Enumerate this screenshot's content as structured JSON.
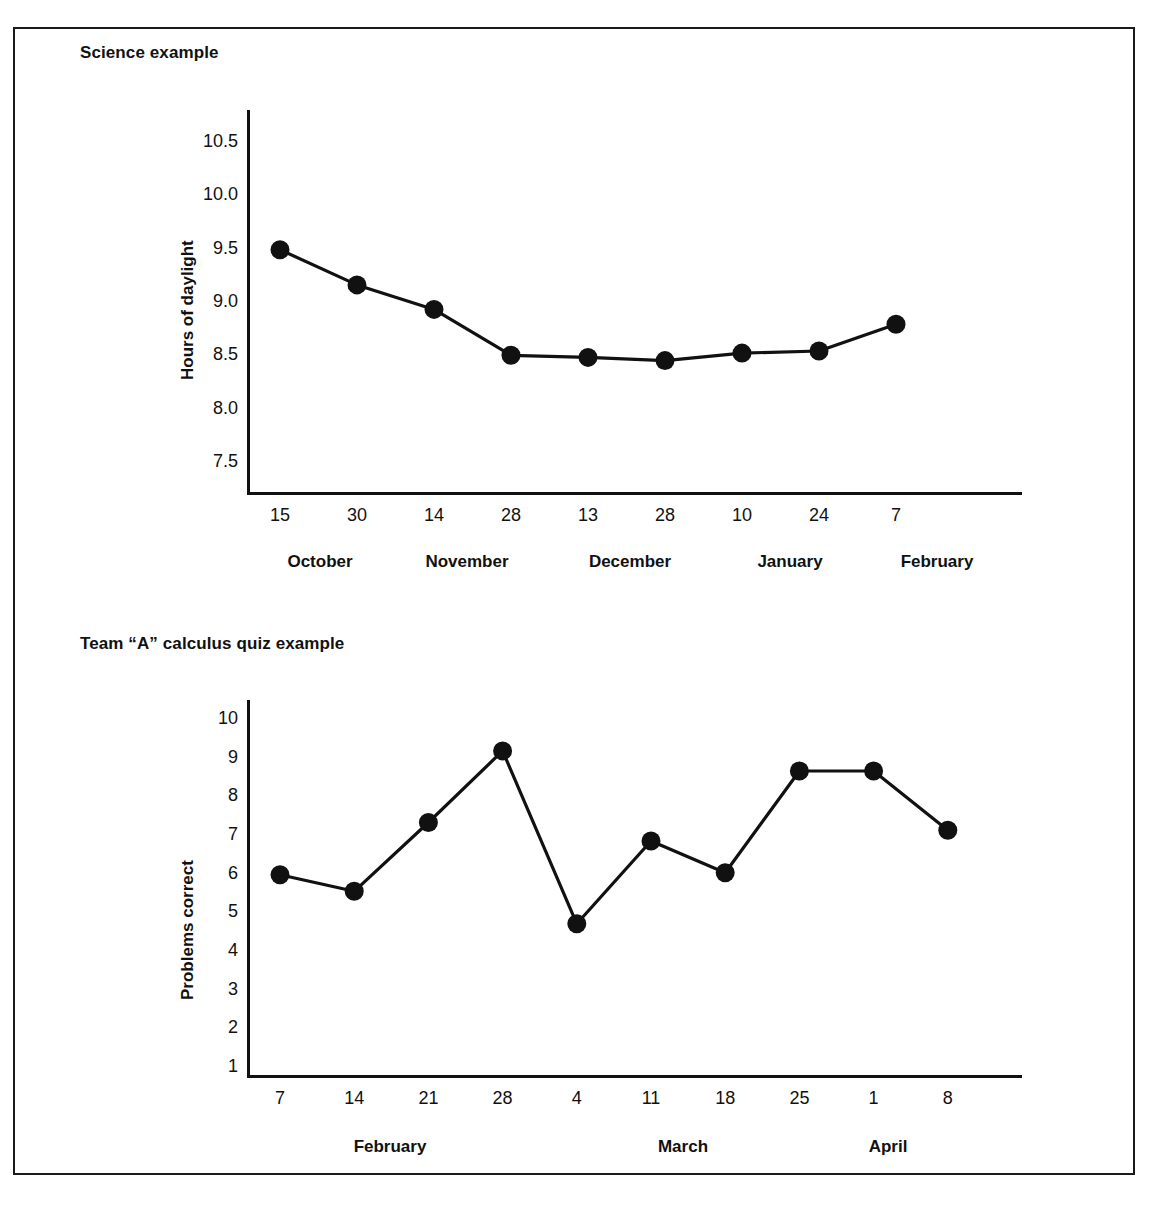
{
  "page": {
    "background_color": "#ffffff",
    "ink_color": "#111111",
    "frame": true
  },
  "charts": [
    {
      "id": "science",
      "title": "Science example",
      "ylabel": "Hours of daylight",
      "yticks": [
        "10.5",
        "10.0",
        "9.5",
        "9.0",
        "8.5",
        "8.0",
        "7.5"
      ],
      "xticks": [
        "15",
        "30",
        "14",
        "28",
        "13",
        "28",
        "10",
        "24",
        "7"
      ],
      "xgroups": [
        "October",
        "November",
        "December",
        "January",
        "February"
      ]
    },
    {
      "id": "calculus",
      "title": "Team “A” calculus quiz example",
      "ylabel": "Problems correct",
      "yticks": [
        "10",
        "9",
        "8",
        "7",
        "6",
        "5",
        "4",
        "3",
        "2",
        "1"
      ],
      "xticks": [
        "7",
        "14",
        "21",
        "28",
        "4",
        "11",
        "18",
        "25",
        "1",
        "8"
      ],
      "xgroups": [
        "February",
        "March",
        "April"
      ]
    }
  ],
  "chart_data": [
    {
      "type": "line",
      "title": "Science example",
      "xlabel": "",
      "ylabel": "Hours of daylight",
      "categories": [
        "15",
        "30",
        "14",
        "28",
        "13",
        "28",
        "10",
        "24",
        "7"
      ],
      "category_groups": [
        "October",
        "October",
        "November",
        "November",
        "December",
        "December",
        "January",
        "January",
        "February"
      ],
      "values": [
        9.5,
        9.17,
        8.94,
        8.51,
        8.49,
        8.46,
        8.53,
        8.55,
        8.8
      ],
      "ylim": [
        7.5,
        10.5
      ],
      "ytick_values": [
        7.5,
        8.0,
        8.5,
        9.0,
        9.5,
        10.0,
        10.5
      ],
      "grid": false,
      "legend": "none",
      "marker": "filled-circle",
      "line_color": "#111111"
    },
    {
      "type": "line",
      "title": "Team “A” calculus quiz example",
      "xlabel": "",
      "ylabel": "Problems correct",
      "categories": [
        "7",
        "14",
        "21",
        "28",
        "4",
        "11",
        "18",
        "25",
        "1",
        "8"
      ],
      "category_groups": [
        "February",
        "February",
        "February",
        "February",
        "March",
        "March",
        "March",
        "March",
        "April",
        "April"
      ],
      "values": [
        6.0,
        5.57,
        7.35,
        9.2,
        4.73,
        6.87,
        6.05,
        8.68,
        8.68,
        7.15
      ],
      "ylim": [
        1,
        10
      ],
      "ytick_values": [
        1,
        2,
        3,
        4,
        5,
        6,
        7,
        8,
        9,
        10
      ],
      "grid": false,
      "legend": "none",
      "marker": "filled-circle",
      "line_color": "#111111"
    }
  ]
}
